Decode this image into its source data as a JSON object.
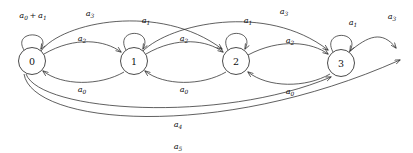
{
  "diagram": {
    "type": "state-transition-diagram",
    "stroke_color": "#2b2b2b",
    "background_color": "#ffffff",
    "states": [
      {
        "id": "0",
        "label": "0",
        "cx": 32,
        "cy": 61,
        "r": 13.5
      },
      {
        "id": "1",
        "label": "1",
        "cx": 134,
        "cy": 61,
        "r": 13.5
      },
      {
        "id": "2",
        "label": "2",
        "cx": 236,
        "cy": 61,
        "r": 13.5
      },
      {
        "id": "3",
        "label": "3",
        "cx": 341,
        "cy": 63,
        "r": 13.5
      }
    ],
    "self_loops": [
      {
        "state": "0",
        "label_base": "a",
        "label_sub": "0 + 1",
        "label_text": "a0 + a1",
        "lx": 33,
        "ly": 15
      },
      {
        "state": "1",
        "label_base": "a",
        "label_sub": "1",
        "label_text": "a1",
        "lx": 146,
        "ly": 20
      },
      {
        "state": "2",
        "label_base": "a",
        "label_sub": "1",
        "label_text": "a1",
        "lx": 248,
        "ly": 20
      },
      {
        "state": "3",
        "label_base": "a",
        "label_sub": "1",
        "label_text": "a1",
        "lx": 353,
        "ly": 22
      }
    ],
    "transitions": [
      {
        "from": "0",
        "to": "1",
        "label_base": "a",
        "label_sub": "2",
        "label_text": "a2",
        "lx": 82,
        "ly": 38,
        "direction": "forward"
      },
      {
        "from": "1",
        "to": "2",
        "label_base": "a",
        "label_sub": "2",
        "label_text": "a2",
        "lx": 184,
        "ly": 38,
        "direction": "forward"
      },
      {
        "from": "2",
        "to": "3",
        "label_base": "a",
        "label_sub": "2",
        "label_text": "a2",
        "lx": 288,
        "ly": 40,
        "direction": "forward"
      },
      {
        "from": "1",
        "to": "0",
        "label_base": "a",
        "label_sub": "0",
        "label_text": "a0",
        "lx": 82,
        "ly": 89,
        "direction": "backward"
      },
      {
        "from": "2",
        "to": "1",
        "label_base": "a",
        "label_sub": "0",
        "label_text": "a0",
        "lx": 184,
        "ly": 89,
        "direction": "backward"
      },
      {
        "from": "3",
        "to": "2",
        "label_base": "a",
        "label_sub": "0",
        "label_text": "a0",
        "lx": 288,
        "ly": 91,
        "direction": "backward"
      },
      {
        "from": "0",
        "to": "2",
        "label_base": "a",
        "label_sub": "3",
        "label_text": "a3",
        "lx": 90,
        "ly": 14,
        "direction": "forward-long"
      },
      {
        "from": "1",
        "to": "3",
        "label_base": "a",
        "label_sub": "3",
        "label_text": "a3",
        "lx": 282,
        "ly": 14,
        "direction": "forward-long"
      },
      {
        "from": "0",
        "to": "3",
        "label_base": "a",
        "label_sub": "4",
        "label_text": "a4",
        "lx": 178,
        "ly": 124,
        "direction": "forward-long"
      }
    ],
    "exit_arrows": [
      {
        "from": "3",
        "label_base": "a",
        "label_sub": "3",
        "label_text": "a3",
        "lx": 393,
        "ly": 17
      },
      {
        "from": "0",
        "label_base": "a",
        "label_sub": "5",
        "label_text": "a5",
        "lx": 178,
        "ly": 146
      }
    ]
  }
}
